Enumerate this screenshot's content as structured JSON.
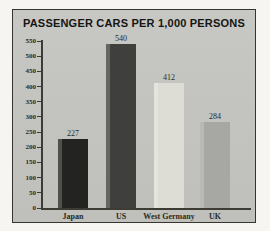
{
  "chart_data": {
    "type": "bar",
    "title": "PASSENGER CARS PER 1,000 PERSONS",
    "categories": [
      "Japan",
      "US",
      "West Germany",
      "UK"
    ],
    "values": [
      227,
      540,
      412,
      284
    ],
    "bar_colors": [
      "#232321",
      "#3f3f3d",
      "#deddd5",
      "#a7a7a3"
    ],
    "xlabel": "",
    "ylabel": "",
    "ylim": [
      0,
      550
    ],
    "yticks": [
      0,
      50,
      100,
      150,
      200,
      250,
      300,
      350,
      400,
      450,
      500,
      550
    ],
    "grid": false,
    "legend": "none"
  },
  "colors": {
    "page_bg": "#f6f5f1",
    "panel_bg": "#c3c3bf",
    "frame_border": "#35352e",
    "axis": "#3c3c34",
    "title_text": "#151513",
    "label_text": "#2b2b25"
  }
}
